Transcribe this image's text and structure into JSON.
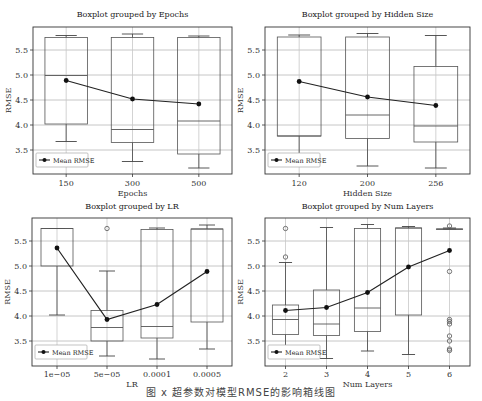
{
  "figure": {
    "caption": "图 x 超参数对模型RMSE的影响箱线图",
    "legend_label": "Mean RMSE",
    "ylabel": "RMSE",
    "yticks": [
      "3.5",
      "4.0",
      "4.5",
      "5.0",
      "5.5"
    ]
  },
  "chart_data": [
    {
      "type": "box",
      "title": "Boxplot grouped by Epochs",
      "xlabel": "Epochs",
      "ylabel": "RMSE",
      "categories": [
        "150",
        "300",
        "500"
      ],
      "ylim": [
        3.02,
        5.96
      ],
      "grid": true,
      "legend_position": "lower left",
      "boxes": [
        {
          "whisker_low": 3.67,
          "q1": 4.02,
          "median": 4.99,
          "q3": 5.75,
          "whisker_high": 5.79,
          "outliers": []
        },
        {
          "whisker_low": 3.27,
          "q1": 3.65,
          "median": 3.91,
          "q3": 5.75,
          "whisker_high": 5.82,
          "outliers": []
        },
        {
          "whisker_low": 3.14,
          "q1": 3.42,
          "median": 4.08,
          "q3": 5.75,
          "whisker_high": 5.78,
          "outliers": []
        }
      ],
      "series": [
        {
          "name": "Mean RMSE",
          "values": [
            4.89,
            4.52,
            4.42
          ]
        }
      ]
    },
    {
      "type": "box",
      "title": "Boxplot grouped by Hidden Size",
      "xlabel": "Hidden Size",
      "ylabel": "RMSE",
      "categories": [
        "120",
        "200",
        "256"
      ],
      "ylim": [
        3.02,
        5.96
      ],
      "grid": true,
      "legend_position": "lower left",
      "boxes": [
        {
          "whisker_low": 3.2,
          "q1": 3.78,
          "median": 3.78,
          "q3": 5.76,
          "whisker_high": 5.8,
          "outliers": []
        },
        {
          "whisker_low": 3.18,
          "q1": 3.73,
          "median": 4.2,
          "q3": 5.76,
          "whisker_high": 5.83,
          "outliers": []
        },
        {
          "whisker_low": 3.14,
          "q1": 3.66,
          "median": 3.98,
          "q3": 5.17,
          "whisker_high": 5.79,
          "outliers": []
        }
      ],
      "series": [
        {
          "name": "Mean RMSE",
          "values": [
            4.87,
            4.56,
            4.39
          ]
        }
      ]
    },
    {
      "type": "box",
      "title": "Boxplot grouped by LR",
      "xlabel": "LR",
      "ylabel": "RMSE",
      "categories": [
        "1e−05",
        "5e−05",
        "0.0001",
        "0.0005"
      ],
      "ylim": [
        3.02,
        5.96
      ],
      "grid": true,
      "legend_position": "lower left",
      "boxes": [
        {
          "whisker_low": 4.02,
          "q1": 5.0,
          "median": 5.75,
          "q3": 5.75,
          "whisker_high": 5.75,
          "outliers": []
        },
        {
          "whisker_low": 3.2,
          "q1": 3.5,
          "median": 3.77,
          "q3": 4.11,
          "whisker_high": 4.9,
          "outliers": [
            5.75
          ]
        },
        {
          "whisker_low": 3.14,
          "q1": 3.56,
          "median": 3.79,
          "q3": 5.73,
          "whisker_high": 5.76,
          "outliers": []
        },
        {
          "whisker_low": 3.34,
          "q1": 3.88,
          "median": 5.74,
          "q3": 5.74,
          "whisker_high": 5.82,
          "outliers": []
        }
      ],
      "series": [
        {
          "name": "Mean RMSE",
          "values": [
            5.36,
            3.93,
            4.23,
            4.89
          ]
        }
      ]
    },
    {
      "type": "box",
      "title": "Boxplot grouped by Num Layers",
      "xlabel": "Num Layers",
      "ylabel": "RMSE",
      "categories": [
        "2",
        "3",
        "4",
        "5",
        "6"
      ],
      "ylim": [
        3.02,
        5.96
      ],
      "grid": true,
      "legend_position": "lower left",
      "boxes": [
        {
          "whisker_low": 3.3,
          "q1": 3.63,
          "median": 3.93,
          "q3": 4.22,
          "whisker_high": 5.07,
          "outliers": [
            5.18,
            5.75
          ]
        },
        {
          "whisker_low": 3.15,
          "q1": 3.61,
          "median": 3.84,
          "q3": 4.52,
          "whisker_high": 5.77,
          "outliers": []
        },
        {
          "whisker_low": 3.3,
          "q1": 3.69,
          "median": 4.16,
          "q3": 5.75,
          "whisker_high": 5.83,
          "outliers": []
        },
        {
          "whisker_low": 3.23,
          "q1": 4.02,
          "median": 5.76,
          "q3": 5.76,
          "whisker_high": 5.79,
          "outliers": []
        },
        {
          "whisker_low": 5.74,
          "q1": 5.74,
          "median": 5.74,
          "q3": 5.74,
          "whisker_high": 5.76,
          "outliers": [
            5.8,
            4.89,
            3.93,
            3.89,
            3.84,
            3.6,
            3.5,
            3.34,
            3.31
          ]
        }
      ],
      "series": [
        {
          "name": "Mean RMSE",
          "values": [
            4.11,
            4.17,
            4.47,
            4.98,
            5.31
          ]
        }
      ]
    }
  ]
}
